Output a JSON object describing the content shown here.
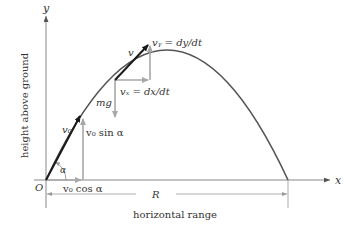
{
  "diagram": {
    "axes": {
      "x_label": "x",
      "y_label": "y",
      "origin_label": "O",
      "x_axis_title": "horizontal range",
      "y_axis_title": "height above ground"
    },
    "range_label": "R",
    "angle_label": "α",
    "initial_velocity": {
      "label": "v₀",
      "vertical_component": "v₀ sin α",
      "horizontal_component": "v₀ cos α"
    },
    "mid_point": {
      "velocity_label": "v",
      "vx_label": "vₓ = dx/dt",
      "vy_label": "vᵧ = dy/dt",
      "force_label": "mg"
    },
    "colors": {
      "trajectory": "#555555",
      "velocity_arrow": "#1a1a1a",
      "component_arrow": "#a8a8a8",
      "axis": "#777777",
      "text": "#333333"
    }
  }
}
